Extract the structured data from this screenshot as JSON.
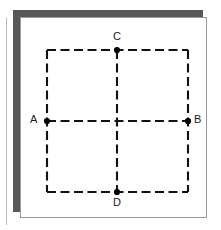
{
  "figure": {
    "background_color": "#ffffff",
    "back_sheet_color": "#585858",
    "card_color": "#ffffff",
    "card_border_color": "#9a9a9a",
    "edge_rule_color": "#b9b9b9",
    "stroke_color": "#111111",
    "dot_color": "#000000",
    "dash_pattern": "9 4.5",
    "stroke_width": 2.1
  },
  "square": {
    "left": 47,
    "top": 50,
    "right": 188,
    "bottom": 192
  },
  "cross": {
    "center_x": 117,
    "center_y": 121
  },
  "points": [
    {
      "id": "A",
      "label": "A",
      "x": 47,
      "y": 121,
      "label_position": "left"
    },
    {
      "id": "B",
      "label": "B",
      "x": 188,
      "y": 121,
      "label_position": "right"
    },
    {
      "id": "C",
      "label": "C",
      "x": 117,
      "y": 50,
      "label_position": "above"
    },
    {
      "id": "D",
      "label": "D",
      "x": 117,
      "y": 192,
      "label_position": "below"
    }
  ],
  "labels": {
    "a": "A",
    "b": "B",
    "c": "C",
    "d": "D"
  }
}
